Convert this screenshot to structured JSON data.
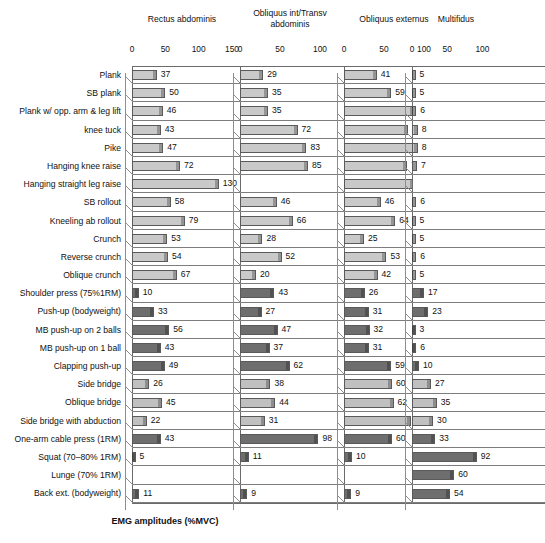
{
  "chart_data": {
    "type": "bar",
    "title": "",
    "xlabel": "EMG amplitudes (%MVC)",
    "ylabel": "",
    "orientation": "horizontal",
    "grid": true,
    "legend": "none",
    "categories": [
      "Plank",
      "SB plank",
      "Plank w/ opp. arm & leg lift",
      "knee tuck",
      "Pike",
      "Hanging knee raise",
      "Hanging straight leg raise",
      "SB rollout",
      "Kneeling ab rollout",
      "Crunch",
      "Reverse crunch",
      "Oblique crunch",
      "Shoulder press (75%1RM)",
      "Push-up (bodyweight)",
      "MB push-up on 2 balls",
      "MB push-up on 1 ball",
      "Clapping push-up",
      "Side bridge",
      "Oblique bridge",
      "Side bridge with abduction",
      "One-arm cable press (1RM)",
      "Squat (70–80% 1RM)",
      "Lunge (70% 1RM)",
      "Back ext. (bodyweight)"
    ],
    "group_shades": [
      "light",
      "light",
      "light",
      "light",
      "light",
      "light",
      "light",
      "light",
      "light",
      "light",
      "light",
      "light",
      "dark",
      "dark",
      "dark",
      "dark",
      "dark",
      "mid",
      "mid",
      "mid",
      "dark",
      "dark",
      "dark",
      "dark"
    ],
    "panels": [
      {
        "name": "Rectus abdominis",
        "xlim": [
          0,
          150
        ],
        "ticks": [
          0,
          50,
          100,
          150
        ],
        "values": [
          37,
          50,
          46,
          43,
          47,
          72,
          130,
          58,
          79,
          53,
          54,
          67,
          10,
          33,
          56,
          43,
          49,
          26,
          45,
          22,
          43,
          5,
          null,
          11
        ]
      },
      {
        "name": "Obliquus int/Transv abdominis",
        "xlim": [
          0,
          125
        ],
        "ticks": [
          0,
          50,
          100
        ],
        "values": [
          29,
          35,
          35,
          72,
          83,
          85,
          null,
          46,
          66,
          28,
          52,
          20,
          43,
          27,
          47,
          37,
          62,
          38,
          44,
          31,
          98,
          11,
          null,
          9
        ]
      },
      {
        "name": "Obliquus externus",
        "xlim": [
          0,
          125
        ],
        "ticks": [
          0,
          50,
          100
        ],
        "values": [
          41,
          59,
          87,
          80,
          96,
          79,
          88,
          46,
          64,
          25,
          53,
          42,
          26,
          31,
          32,
          31,
          59,
          60,
          62,
          84,
          60,
          10,
          null,
          9
        ]
      },
      {
        "name": "Multifidus",
        "xlim": [
          0,
          125
        ],
        "ticks": [
          0,
          50,
          100
        ],
        "values": [
          5,
          5,
          6,
          8,
          8,
          7,
          null,
          6,
          5,
          5,
          6,
          5,
          17,
          23,
          3,
          6,
          10,
          27,
          35,
          30,
          33,
          92,
          60,
          54
        ]
      }
    ],
    "colors": {
      "light": "#c9c9c9",
      "mid": "#c0c0c0",
      "dark": "#6e6e6e",
      "axis": "#6b6b6b",
      "gridline": "#7d7d7d",
      "text": "#111111"
    }
  }
}
